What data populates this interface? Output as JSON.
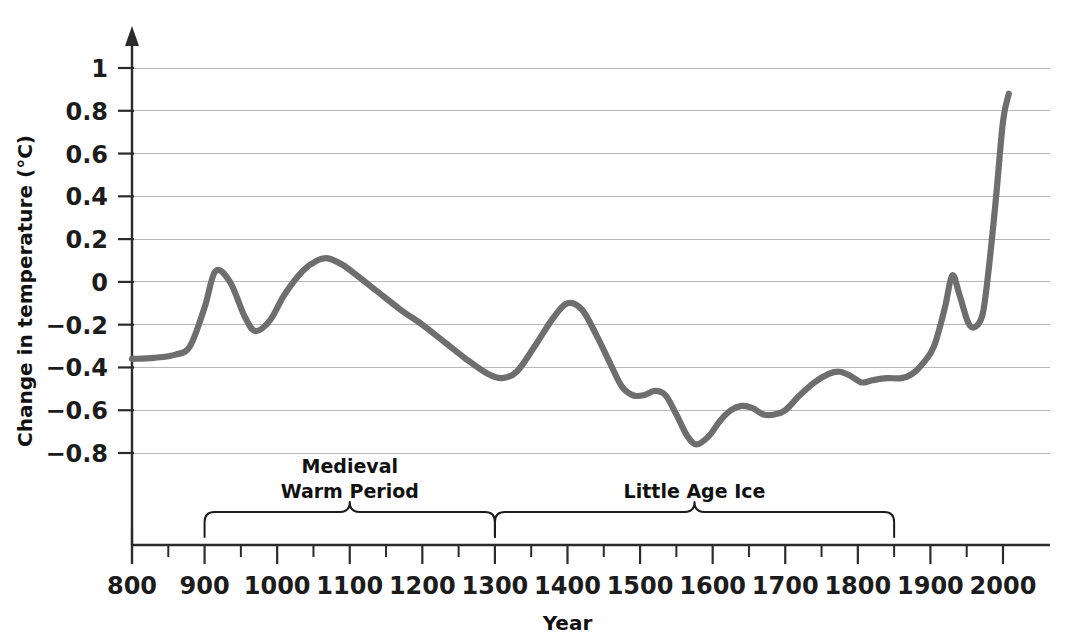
{
  "chart_data": {
    "type": "line",
    "title": "",
    "xlabel": "Year",
    "ylabel": "Change in temperature (°C)",
    "xlim": [
      800,
      2010
    ],
    "ylim": [
      -0.95,
      1.08
    ],
    "grid": true,
    "legend": "none",
    "line_color": "#6e6e6e",
    "x_ticks": [
      800,
      900,
      1000,
      1100,
      1200,
      1300,
      1400,
      1500,
      1600,
      1700,
      1800,
      1900,
      2000
    ],
    "x_minor_tick_step": 50,
    "y_ticks": [
      1,
      0.8,
      0.6,
      0.4,
      0.2,
      0,
      -0.2,
      -0.4,
      -0.6,
      -0.8
    ],
    "y_tick_labels": [
      "1",
      "0.8",
      "0.6",
      "0.4",
      "0.2",
      "0",
      "−0.2",
      "−0.4",
      "−0.6",
      "−0.8"
    ],
    "series": [
      {
        "name": "Change in temperature",
        "x": [
          800,
          830,
          860,
          880,
          900,
          915,
          935,
          955,
          970,
          990,
          1010,
          1035,
          1055,
          1070,
          1090,
          1110,
          1140,
          1170,
          1200,
          1230,
          1260,
          1290,
          1310,
          1330,
          1355,
          1380,
          1400,
          1420,
          1440,
          1460,
          1475,
          1490,
          1505,
          1520,
          1535,
          1550,
          1565,
          1578,
          1595,
          1610,
          1625,
          1640,
          1655,
          1670,
          1685,
          1700,
          1720,
          1740,
          1760,
          1775,
          1790,
          1805,
          1820,
          1840,
          1860,
          1875,
          1890,
          1905,
          1920,
          1930,
          1940,
          1952,
          1962,
          1972,
          1980,
          1990,
          2000,
          2008
        ],
        "y": [
          -0.36,
          -0.355,
          -0.34,
          -0.3,
          -0.12,
          0.05,
          0.0,
          -0.16,
          -0.23,
          -0.18,
          -0.06,
          0.05,
          0.1,
          0.11,
          0.08,
          0.03,
          -0.05,
          -0.13,
          -0.2,
          -0.28,
          -0.36,
          -0.43,
          -0.45,
          -0.42,
          -0.3,
          -0.17,
          -0.1,
          -0.13,
          -0.25,
          -0.39,
          -0.49,
          -0.53,
          -0.53,
          -0.51,
          -0.53,
          -0.62,
          -0.72,
          -0.76,
          -0.72,
          -0.65,
          -0.6,
          -0.58,
          -0.59,
          -0.62,
          -0.62,
          -0.6,
          -0.53,
          -0.47,
          -0.43,
          -0.42,
          -0.44,
          -0.47,
          -0.46,
          -0.45,
          -0.45,
          -0.43,
          -0.38,
          -0.3,
          -0.12,
          0.03,
          -0.06,
          -0.19,
          -0.21,
          -0.15,
          0.05,
          0.38,
          0.75,
          0.88
        ]
      }
    ],
    "annotations": [
      {
        "label": "Medieval\nWarm Period",
        "label_line_1": "Medieval",
        "label_line_2": "Warm Period",
        "brace_start_year": 900,
        "brace_end_year": 1300
      },
      {
        "label": "Little Age Ice",
        "label_line_1": "Little Age Ice",
        "label_line_2": "",
        "brace_start_year": 1300,
        "brace_end_year": 1850
      }
    ]
  }
}
